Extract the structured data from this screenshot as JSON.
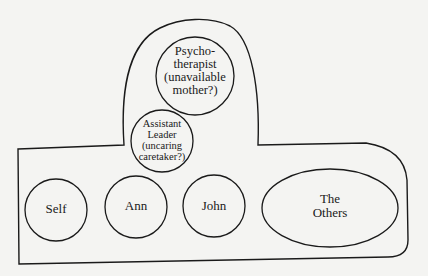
{
  "diagram": {
    "type": "group-relationship-diagram",
    "container": "group boundary (outer enclosure with raised leader section)",
    "nodes": [
      {
        "id": "psychotherapist",
        "label": "Psycho-\ntherapist\n(unavailable\nmother?)",
        "shape": "circle"
      },
      {
        "id": "assistant_leader",
        "label": "Assistant\nLeader\n(uncaring\ncaretaker?)",
        "shape": "circle"
      },
      {
        "id": "self",
        "label": "Self",
        "shape": "circle"
      },
      {
        "id": "ann",
        "label": "Ann",
        "shape": "circle"
      },
      {
        "id": "john",
        "label": "John",
        "shape": "circle"
      },
      {
        "id": "others",
        "label": "The\nOthers",
        "shape": "ellipse"
      }
    ],
    "colors": {
      "stroke": "#1a1a1a",
      "background": "#f4f4f2"
    }
  }
}
